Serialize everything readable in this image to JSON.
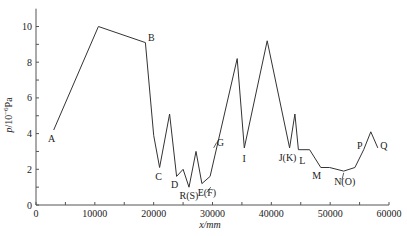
{
  "chart_data": {
    "type": "line",
    "title": "",
    "xlabel": "x/mm",
    "ylabel": "p/10⁻⁶Pa",
    "xlim": [
      0,
      60000
    ],
    "ylim": [
      0,
      11
    ],
    "x_ticks": [
      0,
      10000,
      20000,
      30000,
      40000,
      50000,
      60000
    ],
    "y_ticks": [
      0,
      2,
      4,
      6,
      8,
      10
    ],
    "grid": false,
    "legend": null,
    "series": [
      {
        "name": "pressure",
        "x": [
          3000,
          10600,
          18600,
          20000,
          21000,
          22700,
          23900,
          25000,
          26000,
          27200,
          28200,
          29600,
          34200,
          35400,
          39300,
          43100,
          44000,
          44600,
          46500,
          48400,
          49900,
          52300,
          54200,
          55700,
          56900,
          58100
        ],
        "y": [
          4.2,
          10.0,
          9.1,
          3.9,
          2.1,
          5.1,
          1.6,
          2.0,
          1.0,
          3.0,
          1.2,
          1.6,
          8.2,
          3.2,
          9.2,
          3.2,
          5.1,
          3.1,
          3.1,
          2.1,
          2.1,
          1.9,
          2.1,
          3.1,
          4.1,
          3.2
        ]
      }
    ],
    "annotations": [
      {
        "text": "A",
        "x": 3000,
        "y": 4.2
      },
      {
        "text": "B",
        "x": 18600,
        "y": 9.1
      },
      {
        "text": "C",
        "x": 21000,
        "y": 2.1
      },
      {
        "text": "D",
        "x": 23900,
        "y": 1.6
      },
      {
        "text": "R(S)",
        "x": 26000,
        "y": 1.0
      },
      {
        "text": "E(F)",
        "x": 28200,
        "y": 1.2
      },
      {
        "text": "G",
        "x": 30500,
        "y": 3.4
      },
      {
        "text": "I",
        "x": 35400,
        "y": 3.2
      },
      {
        "text": "J(K)",
        "x": 43100,
        "y": 3.2
      },
      {
        "text": "L",
        "x": 44600,
        "y": 3.1
      },
      {
        "text": "M",
        "x": 48400,
        "y": 2.1
      },
      {
        "text": "N(O)",
        "x": 52300,
        "y": 1.9
      },
      {
        "text": "P",
        "x": 55700,
        "y": 3.1
      },
      {
        "text": "Q",
        "x": 58100,
        "y": 3.2
      }
    ]
  },
  "labels": {
    "xlabel": "x/mm",
    "ylabel_main": "p",
    "ylabel_unit": "/10",
    "ylabel_exp": "−6",
    "ylabel_pa": "Pa"
  },
  "colors": {
    "line": "#333333",
    "axis": "#555555",
    "text": "#222222"
  }
}
